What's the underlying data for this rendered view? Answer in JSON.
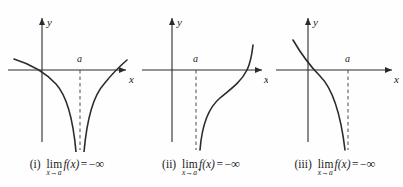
{
  "figure": {
    "background_color": "#fefefe",
    "ink_color": "#2b2b2b",
    "dash_color": "#4a4a4a"
  },
  "panels": [
    {
      "id": "panel-i",
      "label": "(i)",
      "lim_text": "lim",
      "sub_var": "x",
      "sub_arrow": "→",
      "sub_point": "a",
      "sub_sign": "",
      "function_text": "f(x)",
      "equals_sign": "=",
      "minus_sign": "−",
      "infinity": "∞",
      "axis_x_label": "x",
      "axis_y_label": "y",
      "asymptote_label": "a",
      "description": "two-sided vertical asymptote, both branches to minus infinity"
    },
    {
      "id": "panel-ii",
      "label": "(ii)",
      "lim_text": "lim",
      "sub_var": "x",
      "sub_arrow": "→",
      "sub_point": "a",
      "sub_sign": "+",
      "function_text": "f(x)",
      "equals_sign": "=",
      "minus_sign": "−",
      "infinity": "∞",
      "axis_x_label": "x",
      "axis_y_label": "y",
      "asymptote_label": "a",
      "description": "right-hand branch rising from minus infinity, crosses x-axis at right"
    },
    {
      "id": "panel-iii",
      "label": "(iii)",
      "lim_text": "lim",
      "sub_var": "x",
      "sub_arrow": "→",
      "sub_point": "a",
      "sub_sign": "−",
      "function_text": "f(x)",
      "equals_sign": "=",
      "minus_sign": "−",
      "infinity": "∞",
      "axis_x_label": "x",
      "axis_y_label": "y",
      "asymptote_label": "a",
      "description": "left-hand branch decreasing to minus infinity at asymptote"
    }
  ]
}
